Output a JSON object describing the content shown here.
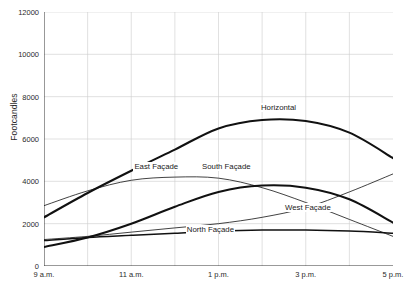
{
  "chart_data": {
    "type": "line",
    "title": "",
    "xlabel": "",
    "ylabel": "Footcandles",
    "xlim": [
      9,
      17
    ],
    "ylim": [
      0,
      12000
    ],
    "grid": true,
    "legend_position": "inline-labels",
    "x_tick_labels": [
      "9 a.m.",
      "11 a.m.",
      "1 p.m.",
      "3 p.m.",
      "5 p.m."
    ],
    "x_tick_values": [
      9,
      11,
      13,
      15,
      17
    ],
    "x_minor_ticks": [
      10,
      12,
      14,
      16
    ],
    "y_tick_labels": [
      "0",
      "2000",
      "4000",
      "6000",
      "8000",
      "10000",
      "12000"
    ],
    "y_tick_values": [
      0,
      2000,
      4000,
      6000,
      8000,
      10000,
      12000
    ],
    "y_minor_ticks": [
      1000,
      3000,
      5000,
      7000,
      9000,
      11000
    ],
    "x": [
      9,
      10,
      11,
      12,
      13,
      14,
      15,
      16,
      17
    ],
    "series": [
      {
        "name": "Horizontal",
        "values": [
          2300,
          3450,
          4500,
          5500,
          6500,
          6900,
          6850,
          6300,
          5100
        ],
        "width": 2.1,
        "label_x": 13.95,
        "label_y": 7450
      },
      {
        "name": "East Façade",
        "values": [
          2850,
          3550,
          4050,
          4200,
          4150,
          3700,
          3000,
          2200,
          1400
        ],
        "width": 0.8,
        "label_x": 11.05,
        "label_y": 4700
      },
      {
        "name": "South Façade",
        "values": [
          900,
          1350,
          2000,
          2800,
          3500,
          3800,
          3700,
          3150,
          2050
        ],
        "width": 2.1,
        "label_x": 12.6,
        "label_y": 4700
      },
      {
        "name": "West Façade",
        "values": [
          1250,
          1400,
          1600,
          1800,
          2000,
          2300,
          2750,
          3500,
          4350
        ],
        "width": 0.8,
        "label_x": 14.5,
        "label_y": 2750
      },
      {
        "name": "North Façade",
        "values": [
          1200,
          1350,
          1450,
          1550,
          1650,
          1700,
          1700,
          1650,
          1550
        ],
        "width": 1.5,
        "label_x": 12.25,
        "label_y": 1720
      }
    ],
    "colors": {
      "line": "#111111",
      "grid": "#cccccc",
      "axis": "#555555",
      "background": "#ffffff"
    }
  }
}
